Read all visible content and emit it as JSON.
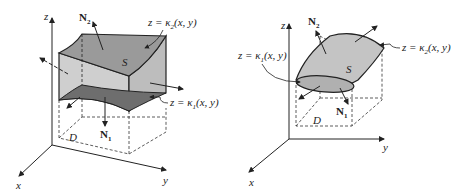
{
  "figures": [
    {
      "id": "left",
      "axes": {
        "x": "x",
        "y": "y",
        "z": "z"
      },
      "region_label": "D",
      "surface_label": "S",
      "normal_top": {
        "base": "N",
        "sub": "2"
      },
      "normal_bottom": {
        "base": "N",
        "sub": "1"
      },
      "top_surface": {
        "prefix": "z = κ",
        "sub": "2",
        "suffix": "(x, y)"
      },
      "bottom_surface": {
        "prefix": "z = κ",
        "sub": "1",
        "suffix": "(x, y)"
      }
    },
    {
      "id": "right",
      "axes": {
        "x": "x",
        "y": "y",
        "z": "z"
      },
      "region_label": "D",
      "surface_label": "S",
      "normal_top": {
        "base": "N",
        "sub": "2"
      },
      "normal_bottom": {
        "base": "N",
        "sub": "1"
      },
      "left_surface": {
        "prefix": "z = κ",
        "sub": "1",
        "suffix": "(x, y)"
      },
      "right_surface": {
        "prefix": "z = κ",
        "sub": "2",
        "suffix": "(x, y)"
      }
    }
  ],
  "colors": {
    "surface_light": "#c8c8c8",
    "surface_mid": "#a8a8a8",
    "surface_dark": "#6e6e6e",
    "line": "#222222"
  }
}
